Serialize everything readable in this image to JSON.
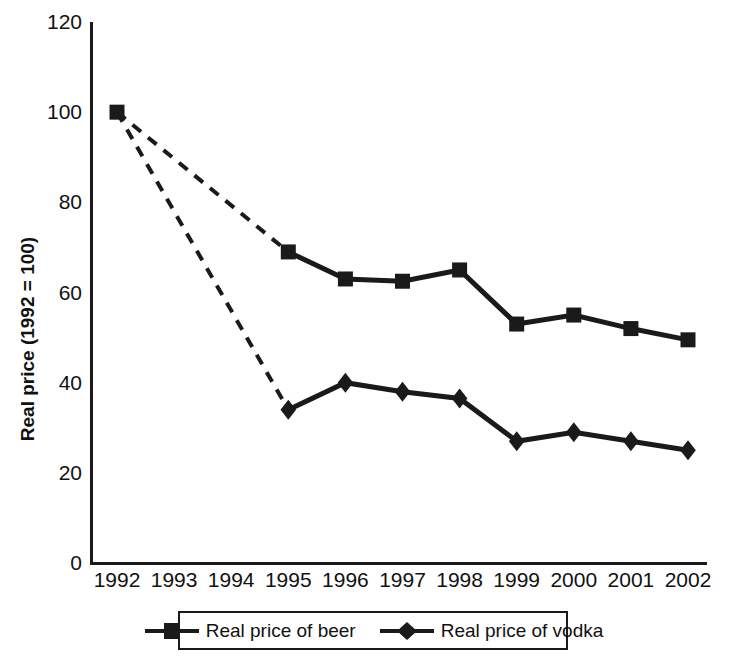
{
  "chart_data": {
    "type": "line",
    "title": "",
    "xlabel": "",
    "ylabel": "Real price (1992 = 100)",
    "categories": [
      "1992",
      "1993",
      "1994",
      "1995",
      "1996",
      "1997",
      "1998",
      "1999",
      "2000",
      "2001",
      "2002"
    ],
    "ylim": [
      0,
      120
    ],
    "yticks": [
      0,
      20,
      40,
      60,
      80,
      100,
      120
    ],
    "ytick_labels": [
      "0",
      "20",
      "40",
      "60",
      "80",
      "100",
      "120"
    ],
    "grid": false,
    "legend_position": "bottom",
    "series": [
      {
        "name": "Real price of beer",
        "marker": "square",
        "values": [
          100,
          null,
          null,
          69,
          63,
          62.5,
          65,
          53,
          55,
          52,
          49.5
        ],
        "note": "dashed connector between 1992 and 1995 (1993 and 1994 not observed)"
      },
      {
        "name": "Real price of vodka",
        "marker": "diamond",
        "values": [
          100,
          null,
          null,
          34,
          40,
          38,
          36.5,
          27,
          29,
          27,
          25
        ],
        "note": "shares the 1992 = 100 index point; dashed connector between 1992 and 1995"
      }
    ]
  },
  "axes": {
    "y_title": "Real price (1992 = 100)"
  },
  "legend": {
    "items": [
      {
        "label": "Real price of beer",
        "marker": "square-marker"
      },
      {
        "label": "Real price of vodka",
        "marker": "diamond-marker"
      }
    ]
  },
  "colors": {
    "ink": "#1a1a1a",
    "background": "#ffffff"
  }
}
